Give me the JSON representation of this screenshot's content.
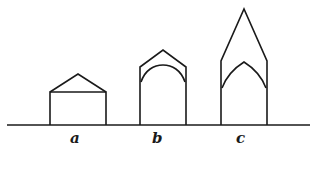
{
  "diagram": {
    "stroke_color": "#1a1a1a",
    "background": "#ffffff",
    "figures": [
      {
        "id": "a",
        "label": "a",
        "shape": "rectangle with low gabled roof"
      },
      {
        "id": "b",
        "label": "b",
        "shape": "gabled outline over round arch"
      },
      {
        "id": "c",
        "label": "c",
        "shape": "tall pointed gable over pointed arch"
      }
    ]
  }
}
